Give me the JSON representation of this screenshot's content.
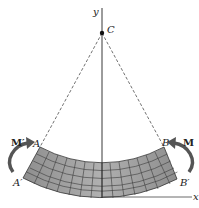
{
  "figure": {
    "type": "pure bending of a beam segment",
    "labels": {
      "axis_y": "y",
      "axis_x": "x",
      "center": "C",
      "point_a": "A",
      "point_b": "B",
      "point_a_prime": "A′",
      "point_b_prime": "B′",
      "moment_left": "M′",
      "moment_right": "M"
    },
    "colors": {
      "beam_fill": "#9a9a9a",
      "grid_line": "#3a3a3a",
      "arrow": "#555555",
      "line": "#222222"
    }
  }
}
